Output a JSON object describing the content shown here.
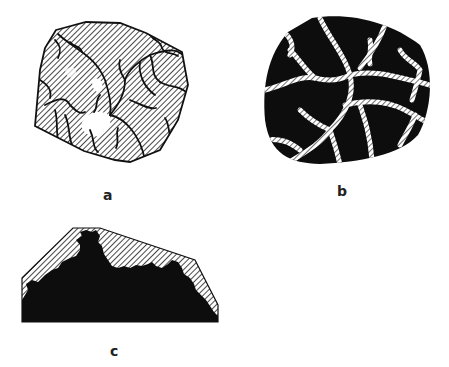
{
  "figure": {
    "panels": [
      {
        "id": "a",
        "label": "a",
        "description": "Polygonal grain, hatched fill with dark branching crack network and small white unhatched patch"
      },
      {
        "id": "b",
        "label": "b",
        "description": "Rounded grain, solid black fill crossed by white hatched vein network"
      },
      {
        "id": "c",
        "label": "c",
        "description": "Trapezoidal section, solid black lower region with ragged boundary and hatched upper region"
      }
    ],
    "colors": {
      "ink": "#111111",
      "paper": "#ffffff",
      "hatch": "#1a1a1a"
    }
  }
}
